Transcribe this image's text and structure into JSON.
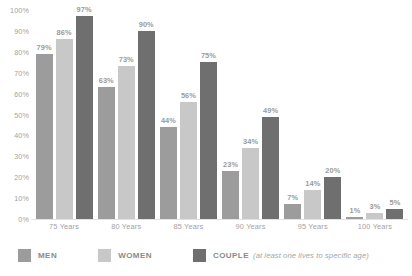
{
  "chart_data": {
    "type": "bar",
    "title": "",
    "subtitle": "",
    "xlabel": "",
    "ylabel": "",
    "ylim": [
      0,
      100
    ],
    "grid": false,
    "legend_position": "bottom-left",
    "categories": [
      "75 Years",
      "80 Years",
      "85 Years",
      "90 Years",
      "95 Years",
      "100 Years"
    ],
    "y_ticks": [
      "100%",
      "90%",
      "80%",
      "70%",
      "60%",
      "50%",
      "40%",
      "30%",
      "20%",
      "10%",
      "0%"
    ],
    "y_tick_values": [
      100,
      90,
      80,
      70,
      60,
      50,
      40,
      30,
      20,
      10,
      0
    ],
    "series": [
      {
        "name": "MEN",
        "color": "#9c9c9c",
        "values": [
          79,
          63,
          44,
          23,
          7,
          1
        ],
        "labels": [
          "79%",
          "63%",
          "44%",
          "23%",
          "7%",
          "1%"
        ]
      },
      {
        "name": "WOMEN",
        "color": "#c8c8c8",
        "values": [
          86,
          73,
          56,
          34,
          14,
          3
        ],
        "labels": [
          "86%",
          "73%",
          "56%",
          "34%",
          "14%",
          "3%"
        ]
      },
      {
        "name": "COUPLE",
        "color": "#6f6f6f",
        "values": [
          97,
          90,
          75,
          49,
          20,
          5
        ],
        "labels": [
          "97%",
          "90%",
          "75%",
          "49%",
          "20%",
          "5%"
        ]
      }
    ]
  },
  "legend": {
    "men_label": "MEN",
    "women_label": "WOMEN",
    "couple_label": "COUPLE",
    "couple_note": "(at least one lives to specific age)"
  }
}
